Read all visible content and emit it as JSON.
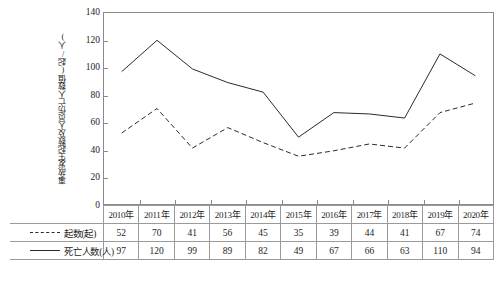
{
  "chart_data": {
    "type": "line",
    "title": "",
    "xlabel": "",
    "ylabel": "事故发生起数及人员伤亡人数值(起/人)",
    "ylim": [
      0,
      140
    ],
    "ytick_values": [
      0,
      20,
      40,
      60,
      80,
      100,
      120,
      140
    ],
    "ytick_labels": [
      "0",
      "20",
      "40",
      "60",
      "80",
      "100",
      "120",
      "140"
    ],
    "grid": false,
    "legend_position": "table-below",
    "categories": [
      "2010年",
      "2011年",
      "2012年",
      "2013年",
      "2014年",
      "2015年",
      "2016年",
      "2017年",
      "2018年",
      "2019年",
      "2020年"
    ],
    "series": [
      {
        "name": "起数(起)",
        "style": "dashed",
        "color": "#2b2b2b",
        "values": [
          52,
          70,
          41,
          56,
          45,
          35,
          39,
          44,
          41,
          67,
          74
        ]
      },
      {
        "name": "死亡人数(人)",
        "style": "solid",
        "color": "#2b2b2b",
        "values": [
          97,
          120,
          99,
          89,
          82,
          49,
          67,
          66,
          63,
          110,
          94
        ]
      }
    ]
  },
  "table": {
    "corner_label": "",
    "header": [
      "2010年",
      "2011年",
      "2012年",
      "2013年",
      "2014年",
      "2015年",
      "2016年",
      "2017年",
      "2018年",
      "2019年",
      "2020年"
    ],
    "rows": [
      {
        "label": "起数(起)",
        "swatch": "dashed",
        "values": [
          "52",
          "70",
          "41",
          "56",
          "45",
          "35",
          "39",
          "44",
          "41",
          "67",
          "74"
        ]
      },
      {
        "label": "死亡人数(人)",
        "swatch": "solid",
        "values": [
          "97",
          "120",
          "99",
          "89",
          "82",
          "49",
          "67",
          "66",
          "63",
          "110",
          "94"
        ]
      }
    ]
  },
  "caption": ""
}
